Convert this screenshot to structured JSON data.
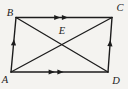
{
  "figure": {
    "width": 128,
    "height": 89,
    "colors": {
      "background": "#f4f3f0",
      "stroke": "#1c1c1c",
      "label": "#1c1c1c"
    },
    "labels": {
      "A": "A",
      "B": "B",
      "C": "C",
      "D": "D",
      "E": "E"
    },
    "points": {
      "A": {
        "x": 11,
        "y": 72,
        "label_x": 5,
        "label_y": 82.5
      },
      "B": {
        "x": 16,
        "y": 17.5,
        "label_x": 10,
        "label_y": 16
      },
      "C": {
        "x": 112,
        "y": 17.5,
        "label_x": 120,
        "label_y": 10.5
      },
      "D": {
        "x": 108,
        "y": 72,
        "label_x": 116,
        "label_y": 84
      },
      "E": {
        "x": 61.8,
        "y": 44.7,
        "label_x": 62,
        "label_y": 34
      }
    },
    "edges": [
      {
        "name": "side-ab",
        "from": "A",
        "to": "B",
        "width": 1.4
      },
      {
        "name": "side-bc",
        "from": "B",
        "to": "C",
        "width": 1.4
      },
      {
        "name": "side-cd",
        "from": "C",
        "to": "D",
        "width": 1.4
      },
      {
        "name": "side-da",
        "from": "D",
        "to": "A",
        "width": 1.4
      },
      {
        "name": "diagonal-ac",
        "from": "A",
        "to": "C",
        "width": 1.3
      },
      {
        "name": "diagonal-bd",
        "from": "B",
        "to": "D",
        "width": 1.3
      }
    ],
    "parallel_marks": [
      {
        "name": "bc-arrow-mark-1",
        "from": "B",
        "to": "C",
        "t": 0.43
      },
      {
        "name": "bc-arrow-mark-2",
        "from": "B",
        "to": "C",
        "t": 0.51
      },
      {
        "name": "ad-arrow-mark-1",
        "from": "A",
        "to": "D",
        "t": 0.42
      },
      {
        "name": "ad-arrow-mark-2",
        "from": "A",
        "to": "D",
        "t": 0.51
      },
      {
        "name": "ab-arrow-mark",
        "from": "A",
        "to": "B",
        "t": 0.545
      },
      {
        "name": "dc-arrow-mark",
        "from": "D",
        "to": "C",
        "t": 0.53
      }
    ]
  }
}
